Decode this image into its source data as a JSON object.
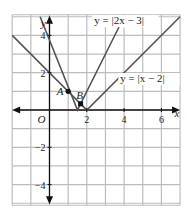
{
  "chart_data": {
    "type": "line",
    "title": "",
    "xlabel": "x",
    "ylabel": "y",
    "xlim": [
      -2,
      7
    ],
    "ylim": [
      -5,
      5
    ],
    "grid": true,
    "origin_label": "O",
    "x_ticks": [
      2,
      4,
      6
    ],
    "y_ticks": [
      4,
      2,
      -2,
      -4
    ],
    "series": [
      {
        "name": "y = |2x − 3|",
        "expr": "abs(2x-3)",
        "points": [
          [
            -0.5,
            5
          ],
          [
            1.5,
            0
          ],
          [
            4,
            5
          ]
        ],
        "color": "#555555"
      },
      {
        "name": "y = |x − 2|",
        "expr": "abs(x-2)",
        "points": [
          [
            -2,
            4
          ],
          [
            2,
            0
          ],
          [
            7,
            5
          ]
        ],
        "color": "#555555"
      }
    ],
    "annotations": [
      {
        "label": "y = |2x − 3|",
        "x": 2.4,
        "y": 4.6
      },
      {
        "label": "y = |x − 2|",
        "x": 3.8,
        "y": 1.5
      },
      {
        "label": "A",
        "x": 1,
        "y": 1,
        "marker": "circle"
      },
      {
        "label": "B",
        "x": 1.667,
        "y": 0.333,
        "marker": "square"
      }
    ]
  }
}
